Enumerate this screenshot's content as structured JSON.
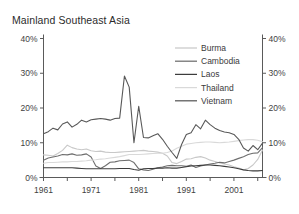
{
  "chart_data": {
    "type": "line",
    "title": "Mainland Southeast Asia",
    "xlabel": "",
    "ylabel": "",
    "ylim": [
      0,
      40
    ],
    "xlim": [
      1961,
      2007
    ],
    "grid": false,
    "legend_position": "top-right",
    "y_tick_labels": [
      "0%",
      "10%",
      "20%",
      "30%",
      "40%"
    ],
    "y_tick_values": [
      0,
      10,
      20,
      30,
      40
    ],
    "y_axis_right_tick_labels": [
      "0%",
      "10%",
      "20%",
      "30%",
      "40%"
    ],
    "x_tick_labels": [
      "1961",
      "1971",
      "1981",
      "1991",
      "2001"
    ],
    "x_tick_values": [
      1961,
      1971,
      1981,
      1991,
      2001
    ],
    "x_minor_tick_values": [
      1961,
      1966,
      1971,
      1976,
      1981,
      1986,
      1991,
      1996,
      2001,
      2006
    ],
    "x": [
      1961,
      1962,
      1963,
      1964,
      1965,
      1966,
      1967,
      1968,
      1969,
      1970,
      1971,
      1972,
      1973,
      1974,
      1975,
      1976,
      1977,
      1978,
      1979,
      1980,
      1981,
      1982,
      1983,
      1984,
      1985,
      1986,
      1987,
      1988,
      1989,
      1990,
      1991,
      1992,
      1993,
      1994,
      1995,
      1996,
      1997,
      1998,
      1999,
      2000,
      2001,
      2002,
      2003,
      2004,
      2005,
      2006,
      2007
    ],
    "series": [
      {
        "name": "Burma",
        "color": "#c8c8c8",
        "values": [
          6.5,
          6.4,
          6.2,
          6.9,
          7.8,
          9.3,
          8.6,
          8.2,
          8.0,
          8.2,
          7.7,
          7.5,
          7.6,
          7.3,
          7.2,
          7.2,
          7.3,
          7.4,
          7.5,
          7.6,
          7.7,
          7.8,
          7.6,
          7.5,
          7.3,
          7.0,
          6.2,
          4.3,
          4.0,
          4.6,
          5.3,
          5.4,
          5.8,
          6.0,
          5.6,
          5.0,
          4.6,
          4.2,
          3.9,
          3.6,
          3.1,
          2.7,
          2.2,
          2.6,
          3.6,
          5.2,
          7.9
        ]
      },
      {
        "name": "Cambodia",
        "color": "#6e6e6e",
        "values": [
          5.0,
          5.6,
          5.9,
          6.2,
          6.6,
          6.5,
          6.8,
          6.4,
          6.5,
          6.8,
          5.9,
          3.3,
          2.6,
          3.4,
          4.4,
          4.5,
          4.8,
          4.9,
          5.0,
          4.3,
          2.5,
          2.2,
          2.0,
          2.4,
          2.8,
          3.0,
          3.4,
          3.5,
          3.4,
          3.4,
          3.2,
          3.6,
          2.9,
          3.3,
          3.6,
          3.9,
          4.1,
          4.4,
          4.2,
          4.6,
          5.0,
          5.5,
          6.0,
          6.6,
          7.0,
          7.1,
          8.6
        ]
      },
      {
        "name": "Laos",
        "color": "#3c3c3c",
        "values": [
          2.8,
          2.8,
          2.8,
          2.8,
          2.8,
          2.8,
          2.8,
          2.7,
          2.6,
          2.5,
          2.5,
          2.5,
          2.5,
          2.5,
          2.5,
          2.5,
          2.6,
          2.6,
          2.6,
          2.3,
          2.1,
          2.5,
          2.6,
          2.6,
          2.7,
          2.7,
          2.8,
          2.7,
          2.7,
          2.9,
          3.1,
          3.3,
          3.4,
          3.5,
          3.6,
          3.6,
          3.5,
          3.4,
          3.2,
          3.0,
          2.8,
          2.5,
          2.2,
          2.0,
          1.9,
          1.9,
          2.0
        ]
      },
      {
        "name": "Thailand",
        "color": "#d9d9d9",
        "values": [
          4.1,
          4.3,
          4.3,
          4.4,
          4.5,
          4.5,
          4.6,
          4.6,
          4.7,
          4.8,
          5.0,
          5.1,
          5.3,
          5.4,
          5.6,
          5.8,
          6.0,
          6.3,
          6.6,
          6.6,
          6.6,
          6.7,
          6.8,
          6.9,
          7.0,
          7.0,
          7.2,
          7.6,
          8.4,
          9.0,
          9.6,
          9.8,
          10.0,
          10.1,
          10.2,
          10.2,
          10.1,
          10.0,
          10.1,
          10.2,
          10.4,
          10.6,
          10.8,
          10.9,
          10.9,
          10.7,
          10.3
        ]
      },
      {
        "name": "Vietnam",
        "color": "#585858",
        "values": [
          12.6,
          13.2,
          14.2,
          13.7,
          15.4,
          16.0,
          14.5,
          15.3,
          16.5,
          16.0,
          16.6,
          16.8,
          17.0,
          16.8,
          16.5,
          17.0,
          17.1,
          29.2,
          26.0,
          10.0,
          20.5,
          11.5,
          11.4,
          12.0,
          12.6,
          11.0,
          9.0,
          7.2,
          5.5,
          9.5,
          12.4,
          12.9,
          15.2,
          14.0,
          16.5,
          15.2,
          14.2,
          13.5,
          13.1,
          12.9,
          12.4,
          11.0,
          8.5,
          7.6,
          9.2,
          8.0,
          9.9
        ]
      }
    ]
  },
  "legend": {
    "items": [
      {
        "label": "Burma"
      },
      {
        "label": "Cambodia"
      },
      {
        "label": "Laos"
      },
      {
        "label": "Thailand"
      },
      {
        "label": "Vietnam"
      }
    ]
  }
}
